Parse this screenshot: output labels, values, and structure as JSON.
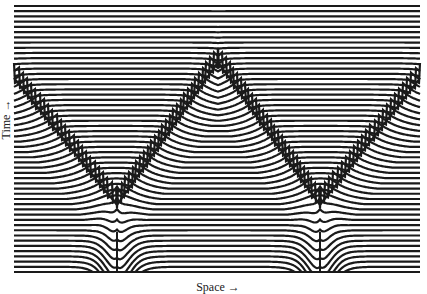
{
  "figure": {
    "xlabel": "Space →",
    "ylabel": "Time →",
    "line_color": "#1a1a1a",
    "background": "#ffffff"
  },
  "plot": {
    "x_min": 14,
    "x_max": 420,
    "y_top": 6,
    "y_bottom": 272,
    "line_count": 52,
    "line_width": 2.2
  },
  "sources": [
    {
      "name": "source-left",
      "x": 117,
      "spike_top": 232
    },
    {
      "name": "source-right",
      "x": 320,
      "spike_top": 232
    }
  ],
  "wavefront": {
    "points": [
      [
        14,
        78
      ],
      [
        117,
        205
      ],
      [
        218,
        62
      ],
      [
        320,
        205
      ],
      [
        420,
        78
      ]
    ]
  }
}
